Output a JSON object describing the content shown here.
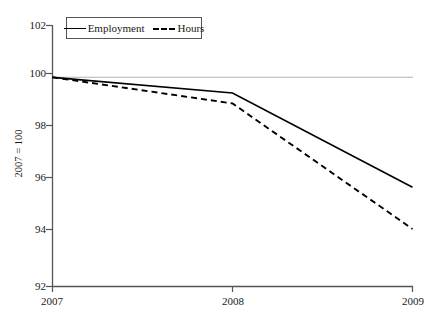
{
  "chart_data": {
    "type": "line",
    "title": "",
    "xlabel": "",
    "ylabel": "2007 = 100",
    "x": [
      2007,
      2008,
      2009
    ],
    "xtick_labels": [
      "2007",
      "2008",
      "2009"
    ],
    "ytick_labels": [
      "92",
      "94",
      "96",
      "98",
      "100",
      "102"
    ],
    "yticks": [
      92,
      94,
      96,
      98,
      100,
      102
    ],
    "ylim": [
      92,
      102
    ],
    "xlim": [
      2007,
      2009
    ],
    "grid": "horizontal-reference-line-at-100",
    "legend_position": "top-left-inside",
    "series": [
      {
        "name": "Employment",
        "style": "solid",
        "color": "#000000",
        "values": [
          100.0,
          99.4,
          95.8
        ]
      },
      {
        "name": "Hours",
        "style": "dashed",
        "color": "#000000",
        "values": [
          100.0,
          99.0,
          94.2
        ]
      }
    ],
    "reference_line": {
      "value": 100,
      "color": "#b3b3b3"
    }
  },
  "legend": {
    "items": [
      {
        "label": "Employment",
        "style": "solid"
      },
      {
        "label": "Hours",
        "style": "dashed"
      }
    ]
  },
  "axes": {
    "y_title": "2007 = 100",
    "y_ticks": [
      {
        "label": "102",
        "value": 102
      },
      {
        "label": "100",
        "value": 100
      },
      {
        "label": "98",
        "value": 98
      },
      {
        "label": "96",
        "value": 96
      },
      {
        "label": "94",
        "value": 94
      },
      {
        "label": "92",
        "value": 92
      }
    ],
    "x_ticks": [
      {
        "label": "2007",
        "value": 2007
      },
      {
        "label": "2008",
        "value": 2008
      },
      {
        "label": "2009",
        "value": 2009
      }
    ]
  },
  "colors": {
    "axis": "#555555",
    "series": "#000000",
    "reference": "#b3b3b3",
    "background": "#ffffff"
  }
}
